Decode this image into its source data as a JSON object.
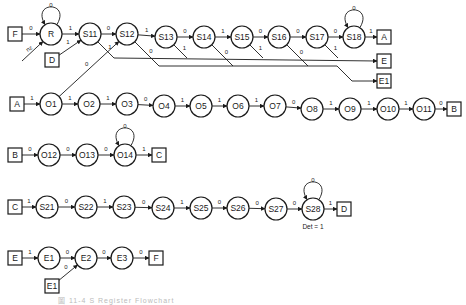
{
  "diagram": {
    "width": 466,
    "height": 305,
    "radius": 11,
    "box": 14,
    "stroke": "#1a1a1a",
    "circles": [
      {
        "id": "R",
        "label": "R",
        "x": 51,
        "y": 34
      },
      {
        "id": "S11",
        "label": "S11",
        "x": 90,
        "y": 34
      },
      {
        "id": "S12",
        "label": "S12",
        "x": 127,
        "y": 34
      },
      {
        "id": "S13",
        "label": "S13",
        "x": 166,
        "y": 37
      },
      {
        "id": "S14",
        "label": "S14",
        "x": 204,
        "y": 37
      },
      {
        "id": "S15",
        "label": "S15",
        "x": 242,
        "y": 37
      },
      {
        "id": "S16",
        "label": "S16",
        "x": 279,
        "y": 37
      },
      {
        "id": "S17",
        "label": "S17",
        "x": 317,
        "y": 37
      },
      {
        "id": "S18",
        "label": "S18",
        "x": 354,
        "y": 37
      },
      {
        "id": "O1",
        "label": "O1",
        "x": 51,
        "y": 104
      },
      {
        "id": "O2",
        "label": "O2",
        "x": 89,
        "y": 104
      },
      {
        "id": "O3",
        "label": "O3",
        "x": 127,
        "y": 104
      },
      {
        "id": "O4",
        "label": "O4",
        "x": 164,
        "y": 106
      },
      {
        "id": "O5",
        "label": "O5",
        "x": 201,
        "y": 106
      },
      {
        "id": "O6",
        "label": "O6",
        "x": 238,
        "y": 106
      },
      {
        "id": "O7",
        "label": "O7",
        "x": 275,
        "y": 106
      },
      {
        "id": "O8",
        "label": "O8",
        "x": 312,
        "y": 109
      },
      {
        "id": "O9",
        "label": "O9",
        "x": 350,
        "y": 109
      },
      {
        "id": "O10",
        "label": "O10",
        "x": 388,
        "y": 109
      },
      {
        "id": "O11",
        "label": "O11",
        "x": 424,
        "y": 109
      },
      {
        "id": "O12",
        "label": "O12",
        "x": 49,
        "y": 155
      },
      {
        "id": "O13",
        "label": "O13",
        "x": 87,
        "y": 155
      },
      {
        "id": "O14",
        "label": "O14",
        "x": 125,
        "y": 155
      },
      {
        "id": "S21",
        "label": "S21",
        "x": 47,
        "y": 207
      },
      {
        "id": "S22",
        "label": "S22",
        "x": 86,
        "y": 207
      },
      {
        "id": "S23",
        "label": "S23",
        "x": 124,
        "y": 207
      },
      {
        "id": "S24",
        "label": "S24",
        "x": 163,
        "y": 208
      },
      {
        "id": "S25",
        "label": "S25",
        "x": 201,
        "y": 208
      },
      {
        "id": "S26",
        "label": "S26",
        "x": 238,
        "y": 208
      },
      {
        "id": "S27",
        "label": "S27",
        "x": 276,
        "y": 209
      },
      {
        "id": "S28",
        "label": "S28",
        "x": 313,
        "y": 209
      },
      {
        "id": "E1n",
        "label": "E1",
        "x": 49,
        "y": 258
      },
      {
        "id": "E2",
        "label": "E2",
        "x": 86,
        "y": 258
      },
      {
        "id": "E3",
        "label": "E3",
        "x": 122,
        "y": 258
      }
    ],
    "boxes": [
      {
        "id": "F_in",
        "label": "F",
        "x": 15,
        "y": 34
      },
      {
        "id": "D_in",
        "label": "D",
        "x": 52,
        "y": 60
      },
      {
        "id": "A_out",
        "label": "A",
        "x": 384,
        "y": 37
      },
      {
        "id": "E_out",
        "label": "E",
        "x": 384,
        "y": 61
      },
      {
        "id": "E1_out",
        "label": "E1",
        "x": 384,
        "y": 81
      },
      {
        "id": "A_in",
        "label": "A",
        "x": 17,
        "y": 104
      },
      {
        "id": "B_out",
        "label": "B",
        "x": 454,
        "y": 109
      },
      {
        "id": "B_in",
        "label": "B",
        "x": 15,
        "y": 155
      },
      {
        "id": "C_out",
        "label": "C",
        "x": 159,
        "y": 155
      },
      {
        "id": "C_in",
        "label": "C",
        "x": 15,
        "y": 207
      },
      {
        "id": "D_out",
        "label": "D",
        "x": 344,
        "y": 209
      },
      {
        "id": "E_in",
        "label": "E",
        "x": 15,
        "y": 258
      },
      {
        "id": "E1_in",
        "label": "E1",
        "x": 52,
        "y": 286
      },
      {
        "id": "F_out",
        "label": "F",
        "x": 156,
        "y": 258
      }
    ],
    "edges": [
      {
        "from": "F_in",
        "to": "R",
        "label": "0"
      },
      {
        "from": "R",
        "to": "S11",
        "label": "1"
      },
      {
        "from": "D_in",
        "to": "S11",
        "label": "1"
      },
      {
        "from": "S11",
        "to": "S12",
        "label": "0"
      },
      {
        "from": "S12",
        "to": "S13",
        "label": "1"
      },
      {
        "from": "S13",
        "to": "S14",
        "label": "0"
      },
      {
        "from": "S14",
        "to": "S15",
        "label": "1"
      },
      {
        "from": "S15",
        "to": "S16",
        "label": "0"
      },
      {
        "from": "S16",
        "to": "S17",
        "label": "0"
      },
      {
        "from": "S17",
        "to": "S18",
        "label": "0"
      },
      {
        "from": "S18",
        "to": "A_out",
        "label": "1"
      },
      {
        "from": "O1",
        "to": "S12",
        "label": "0"
      },
      {
        "from": "A_in",
        "to": "O1",
        "label": "1"
      },
      {
        "from": "O1",
        "to": "O2",
        "label": "1"
      },
      {
        "from": "O2",
        "to": "O3",
        "label": "1"
      },
      {
        "from": "O3",
        "to": "O4",
        "label": "0"
      },
      {
        "from": "O4",
        "to": "O5",
        "label": "1"
      },
      {
        "from": "O5",
        "to": "O6",
        "label": "1"
      },
      {
        "from": "O6",
        "to": "O7",
        "label": "1"
      },
      {
        "from": "O7",
        "to": "O8",
        "label": "0"
      },
      {
        "from": "O8",
        "to": "O9",
        "label": "1"
      },
      {
        "from": "O9",
        "to": "O10",
        "label": "1"
      },
      {
        "from": "O10",
        "to": "O11",
        "label": "1"
      },
      {
        "from": "O11",
        "to": "B_out",
        "label": "0"
      },
      {
        "from": "B_in",
        "to": "O12",
        "label": "0"
      },
      {
        "from": "O12",
        "to": "O13",
        "label": "0"
      },
      {
        "from": "O13",
        "to": "O14",
        "label": "0"
      },
      {
        "from": "O14",
        "to": "C_out",
        "label": "1"
      },
      {
        "from": "C_in",
        "to": "S21",
        "label": "1"
      },
      {
        "from": "S21",
        "to": "S22",
        "label": "0"
      },
      {
        "from": "S22",
        "to": "S23",
        "label": "1"
      },
      {
        "from": "S23",
        "to": "S24",
        "label": "0"
      },
      {
        "from": "S24",
        "to": "S25",
        "label": "1"
      },
      {
        "from": "S25",
        "to": "S26",
        "label": "0"
      },
      {
        "from": "S26",
        "to": "S27",
        "label": "0"
      },
      {
        "from": "S27",
        "to": "S28",
        "label": "0"
      },
      {
        "from": "S28",
        "to": "D_out",
        "label": "1"
      },
      {
        "from": "E_in",
        "to": "E1n",
        "label": "1"
      },
      {
        "from": "E1n",
        "to": "E2",
        "label": "0"
      },
      {
        "from": "E1_in",
        "to": "E2",
        "label": "0"
      },
      {
        "from": "E2",
        "to": "E3",
        "label": "0"
      },
      {
        "from": "E3",
        "to": "F_out",
        "label": "0"
      }
    ],
    "self_loops": [
      {
        "node": "R",
        "label": "0"
      },
      {
        "node": "S18",
        "label": "0"
      },
      {
        "node": "O14",
        "label": "0"
      },
      {
        "node": "S28",
        "label": "0"
      }
    ],
    "reset_input": {
      "to": "R",
      "label": "nz",
      "from_x": 22,
      "from_y": 61
    },
    "bus_E": {
      "label": "1",
      "taps": [
        "S11",
        "S13",
        "S15",
        "S17"
      ],
      "y": 58,
      "target": "E_out"
    },
    "bus_E1": {
      "label": "0",
      "taps": [
        "S12",
        "S14",
        "S16"
      ],
      "y": 66,
      "target": "E1_out"
    },
    "annotations": [
      {
        "text": "Det = 1",
        "x": 313,
        "y": 229
      }
    ]
  },
  "caption": {
    "text": "圖 11-4  S Register Flowchart"
  }
}
